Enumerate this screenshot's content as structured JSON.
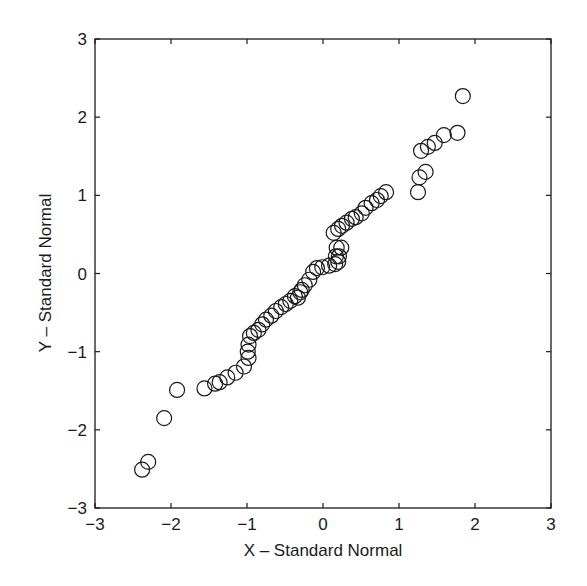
{
  "chart_data": {
    "type": "scatter",
    "title": "",
    "xlabel": "X – Standard Normal",
    "ylabel": "Y – Standard Normal",
    "xlim": [
      -3,
      3
    ],
    "ylim": [
      -3,
      3
    ],
    "xticks": [
      "-3",
      "-2",
      "-1",
      "0",
      "1",
      "2",
      "3"
    ],
    "yticks": [
      "-3",
      "-2",
      "-1",
      "0",
      "1",
      "2",
      "3"
    ],
    "grid": false,
    "legend": null,
    "marker": "open-circle",
    "marker_color": "#1a1a1a",
    "points": [
      [
        -2.38,
        -2.51
      ],
      [
        -2.3,
        -2.41
      ],
      [
        -2.09,
        -1.85
      ],
      [
        -1.92,
        -1.49
      ],
      [
        -1.56,
        -1.47
      ],
      [
        -1.42,
        -1.41
      ],
      [
        -1.36,
        -1.39
      ],
      [
        -1.26,
        -1.33
      ],
      [
        -1.15,
        -1.27
      ],
      [
        -1.04,
        -1.19
      ],
      [
        -0.98,
        -1.08
      ],
      [
        -0.99,
        -1.0
      ],
      [
        -0.98,
        -0.91
      ],
      [
        -0.96,
        -0.8
      ],
      [
        -0.91,
        -0.76
      ],
      [
        -0.85,
        -0.72
      ],
      [
        -0.8,
        -0.65
      ],
      [
        -0.75,
        -0.59
      ],
      [
        -0.68,
        -0.54
      ],
      [
        -0.62,
        -0.48
      ],
      [
        -0.55,
        -0.43
      ],
      [
        -0.49,
        -0.39
      ],
      [
        -0.43,
        -0.35
      ],
      [
        -0.37,
        -0.29
      ],
      [
        -0.33,
        -0.31
      ],
      [
        -0.3,
        -0.24
      ],
      [
        -0.28,
        -0.21
      ],
      [
        -0.24,
        -0.15
      ],
      [
        -0.18,
        -0.08
      ],
      [
        -0.13,
        0.02
      ],
      [
        -0.08,
        0.07
      ],
      [
        -0.01,
        0.08
      ],
      [
        0.08,
        0.1
      ],
      [
        0.16,
        0.12
      ],
      [
        0.2,
        0.15
      ],
      [
        0.21,
        0.22
      ],
      [
        0.17,
        0.22
      ],
      [
        0.24,
        0.33
      ],
      [
        0.18,
        0.33
      ],
      [
        0.14,
        0.52
      ],
      [
        0.2,
        0.57
      ],
      [
        0.25,
        0.61
      ],
      [
        0.31,
        0.65
      ],
      [
        0.38,
        0.7
      ],
      [
        0.43,
        0.72
      ],
      [
        0.51,
        0.77
      ],
      [
        0.56,
        0.84
      ],
      [
        0.64,
        0.9
      ],
      [
        0.71,
        0.94
      ],
      [
        0.76,
        0.99
      ],
      [
        0.83,
        1.04
      ],
      [
        1.25,
        1.04
      ],
      [
        1.27,
        1.23
      ],
      [
        1.35,
        1.3
      ],
      [
        1.29,
        1.57
      ],
      [
        1.38,
        1.62
      ],
      [
        1.47,
        1.67
      ],
      [
        1.59,
        1.77
      ],
      [
        1.77,
        1.8
      ],
      [
        1.84,
        2.27
      ]
    ]
  }
}
